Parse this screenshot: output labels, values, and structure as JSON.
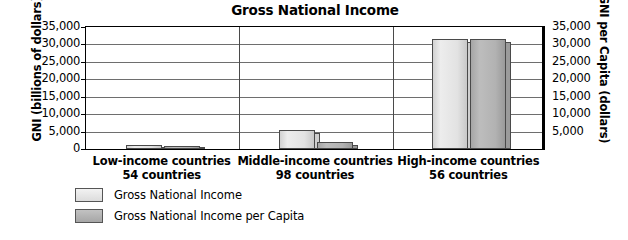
{
  "chart_data": {
    "type": "bar",
    "title": "Gross National Income",
    "xlabel": "",
    "ylabel": "GNI (billions of dollars)",
    "ylabel_right": "GNI per Capita (dollars)",
    "categories": [
      "Low-income countries",
      "Middle-income countries",
      "High-income countries"
    ],
    "category_sublabels": [
      "54 countries",
      "98 countries",
      "56 countries"
    ],
    "series": [
      {
        "name": "Gross National Income",
        "values": [
          1100,
          5400,
          31500
        ],
        "color": "#e3e3e3"
      },
      {
        "name": "Gross National Income per Capita",
        "values": [
          430,
          1900,
          31500
        ],
        "color": "#b0b0b0"
      }
    ],
    "ylim": [
      0,
      35000
    ],
    "ylim_right": [
      0,
      35000
    ],
    "ytick_labels": [
      "35,000",
      "30,000",
      "25,000",
      "20,000",
      "15,000",
      "10,000",
      "5,000",
      "0"
    ],
    "ytick_values": [
      35000,
      30000,
      25000,
      20000,
      15000,
      10000,
      5000,
      0
    ],
    "ytick_labels_right": [
      "35,000",
      "30,000",
      "25,000",
      "20,000",
      "15,000",
      "10,000",
      "5,000"
    ],
    "ytick_values_right": [
      35000,
      30000,
      25000,
      20000,
      15000,
      10000,
      5000
    ],
    "grid": true,
    "legend_position": "below-left"
  },
  "legend": {
    "items": [
      {
        "label": "Gross National Income",
        "swatch": "#e3e3e3"
      },
      {
        "label": "Gross National Income per Capita",
        "swatch": "#b0b0b0"
      }
    ]
  }
}
